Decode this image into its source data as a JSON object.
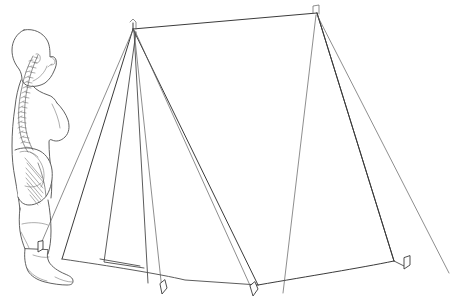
{
  "scene": {
    "title": "A-frame ridge tent with human figure for scale",
    "description": "Line drawing of a two-pole A-frame ridge tent with guy lines and ground pegs, shown beside an anatomical side view of a standing human body with the spine outlined",
    "width": 463,
    "height": 308,
    "background_color": "#ffffff",
    "line_color": "#4a4a4a"
  },
  "figure": {
    "name": "human-scale-figure",
    "label": "Standing human figure, lateral view with spinal column",
    "parts": [
      "head",
      "neck",
      "spine",
      "torso",
      "pelvis",
      "leg",
      "foot"
    ]
  },
  "tent": {
    "name": "a-frame-tent",
    "label": "A-frame ridge tent",
    "components": [
      {
        "name": "ridge-line",
        "label": "Ridge line"
      },
      {
        "name": "front-pole",
        "label": "Front upright pole"
      },
      {
        "name": "rear-pole",
        "label": "Rear upright pole"
      },
      {
        "name": "front-panel",
        "label": "Front triangular panel"
      },
      {
        "name": "door-flap",
        "label": "Door flap"
      },
      {
        "name": "side-wall",
        "label": "Side wall"
      },
      {
        "name": "ground-edge",
        "label": "Ground edge"
      }
    ],
    "guy_lines": [
      {
        "name": "guy-line-front-left",
        "label": "Front left guy line"
      },
      {
        "name": "guy-line-front-centre",
        "label": "Front centre guy line"
      },
      {
        "name": "guy-line-front-right",
        "label": "Front right guy line"
      },
      {
        "name": "guy-line-rear-left",
        "label": "Rear left guy line"
      },
      {
        "name": "guy-line-rear-right",
        "label": "Rear right guy line"
      }
    ],
    "pegs": [
      {
        "name": "peg-far-left",
        "label": "Far left ground peg"
      },
      {
        "name": "peg-front-left",
        "label": "Front left ground peg"
      },
      {
        "name": "peg-front-centre",
        "label": "Front centre ground peg"
      },
      {
        "name": "peg-rear-right",
        "label": "Rear right ground peg"
      }
    ]
  }
}
